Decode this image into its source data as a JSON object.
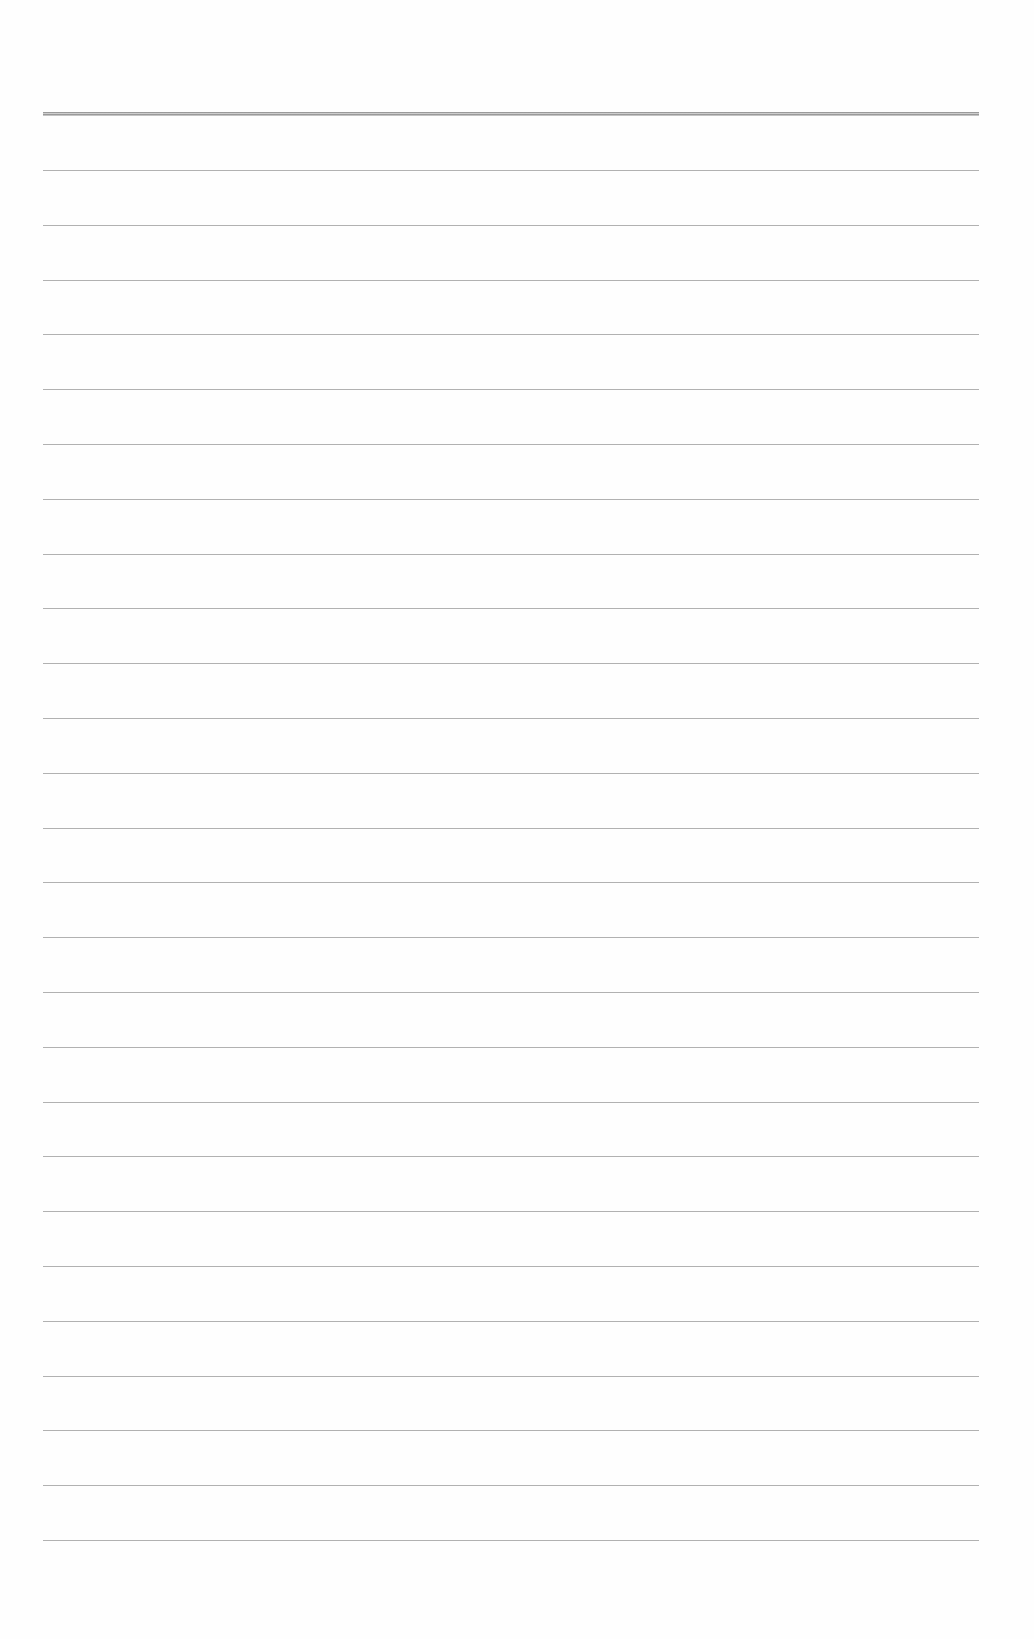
{
  "page": {
    "type": "blank lined sheet",
    "background_color": "#fefefe",
    "rule_color": "#a3a3a3",
    "header_rule": {
      "top": 112,
      "thickness": 4
    },
    "rules": {
      "count": 26,
      "first_top": 170,
      "spacing": 54.8,
      "left": 43,
      "width": 936
    }
  }
}
